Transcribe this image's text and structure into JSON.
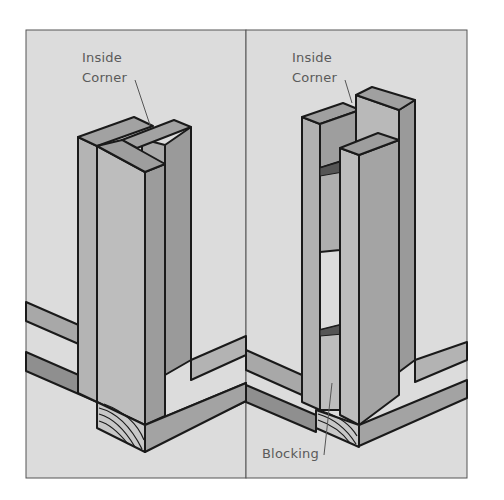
{
  "figure": {
    "panels": [
      {
        "id": "left",
        "description": "Inside corner formed by a stud nailed to the edge of an end stud (three-stud corner)",
        "labels": [
          {
            "text_line1": "Inside",
            "text_line2": "Corner"
          }
        ]
      },
      {
        "id": "right",
        "description": "Inside corner formed by two studs with blocking between them and a third stud",
        "labels": [
          {
            "text_line1": "Inside",
            "text_line2": "Corner"
          },
          {
            "text": "Blocking"
          }
        ]
      }
    ],
    "colors": {
      "background": "#dcdcdc",
      "frame_border": "#555555",
      "wood_light": "#b9b9b9",
      "wood_mid": "#a4a4a4",
      "wood_dark": "#8f8f8f",
      "outline": "#1a1a1a",
      "label": "#5a5a5a"
    }
  }
}
